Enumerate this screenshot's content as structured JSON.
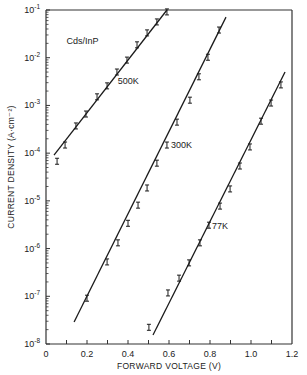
{
  "chart_data": {
    "type": "scatter",
    "title": "",
    "xlabel": "FORWARD VOLTAGE (V)",
    "ylabel": "CURRENT DENSITY (A·cm⁻²)",
    "xlim": [
      0,
      1.2
    ],
    "ylim_log10": [
      -8,
      -1
    ],
    "yscale": "log",
    "grid": false,
    "x_ticks": [
      {
        "value": 0,
        "label": "0"
      },
      {
        "value": 0.2,
        "label": "0.2"
      },
      {
        "value": 0.4,
        "label": "0.4"
      },
      {
        "value": 0.6,
        "label": "0.6"
      },
      {
        "value": 0.8,
        "label": "0.8"
      },
      {
        "value": 1.0,
        "label": "1.0"
      },
      {
        "value": 1.2,
        "label": "1.2"
      }
    ],
    "y_ticks": [
      {
        "exp": -1,
        "label": "10",
        "sup": "-1"
      },
      {
        "exp": -2,
        "label": "10",
        "sup": "-2"
      },
      {
        "exp": -3,
        "label": "10",
        "sup": "-3"
      },
      {
        "exp": -4,
        "label": "10",
        "sup": "-4"
      },
      {
        "exp": -5,
        "label": "10",
        "sup": "-5"
      },
      {
        "exp": -6,
        "label": "10",
        "sup": "-6"
      },
      {
        "exp": -7,
        "label": "10",
        "sup": "-7"
      },
      {
        "exp": -8,
        "label": "10",
        "sup": "-8"
      }
    ],
    "annotations": [
      {
        "text": "Cds/InP",
        "x": 0.1,
        "log10_y": -1.72
      },
      {
        "text": "500K",
        "x": 0.35,
        "log10_y": -2.55
      },
      {
        "text": "300K",
        "x": 0.61,
        "log10_y": -3.9
      },
      {
        "text": "77K",
        "x": 0.81,
        "log10_y": -5.58
      }
    ],
    "series": [
      {
        "name": "500K",
        "fit_line": {
          "x": [
            0.039,
            0.59
          ],
          "log10_y": [
            -4.04,
            -1.0
          ]
        },
        "points": [
          {
            "x": 0.054,
            "log10_y": -4.17
          },
          {
            "x": 0.093,
            "log10_y": -3.83
          },
          {
            "x": 0.146,
            "log10_y": -3.43
          },
          {
            "x": 0.195,
            "log10_y": -3.18
          },
          {
            "x": 0.249,
            "log10_y": -2.82
          },
          {
            "x": 0.298,
            "log10_y": -2.59
          },
          {
            "x": 0.346,
            "log10_y": -2.3
          },
          {
            "x": 0.395,
            "log10_y": -2.05
          },
          {
            "x": 0.444,
            "log10_y": -1.73
          },
          {
            "x": 0.493,
            "log10_y": -1.48
          },
          {
            "x": 0.541,
            "log10_y": -1.25
          },
          {
            "x": 0.59,
            "log10_y": -1.04
          }
        ]
      },
      {
        "name": "300K",
        "fit_line": {
          "x": [
            0.137,
            0.878
          ],
          "log10_y": [
            -7.54,
            -1.15
          ]
        },
        "points": [
          {
            "x": 0.2,
            "log10_y": -7.04
          },
          {
            "x": 0.298,
            "log10_y": -6.28
          },
          {
            "x": 0.351,
            "log10_y": -5.88
          },
          {
            "x": 0.4,
            "log10_y": -5.47
          },
          {
            "x": 0.449,
            "log10_y": -5.09
          },
          {
            "x": 0.493,
            "log10_y": -4.73
          },
          {
            "x": 0.541,
            "log10_y": -4.21
          },
          {
            "x": 0.59,
            "log10_y": -3.83
          },
          {
            "x": 0.639,
            "log10_y": -3.35
          },
          {
            "x": 0.702,
            "log10_y": -2.89
          },
          {
            "x": 0.746,
            "log10_y": -2.4
          },
          {
            "x": 0.79,
            "log10_y": -1.99
          },
          {
            "x": 0.844,
            "log10_y": -1.42
          }
        ]
      },
      {
        "name": "77K",
        "fit_line": {
          "x": [
            0.522,
            1.166
          ],
          "log10_y": [
            -7.81,
            -2.3
          ]
        },
        "points": [
          {
            "x": 0.502,
            "log10_y": -7.65
          },
          {
            "x": 0.595,
            "log10_y": -6.93
          },
          {
            "x": 0.649,
            "log10_y": -6.62
          },
          {
            "x": 0.698,
            "log10_y": -6.3
          },
          {
            "x": 0.751,
            "log10_y": -5.88
          },
          {
            "x": 0.795,
            "log10_y": -5.51
          },
          {
            "x": 0.849,
            "log10_y": -5.11
          },
          {
            "x": 0.898,
            "log10_y": -4.75
          },
          {
            "x": 0.946,
            "log10_y": -4.27
          },
          {
            "x": 0.995,
            "log10_y": -3.87
          },
          {
            "x": 1.049,
            "log10_y": -3.33
          },
          {
            "x": 1.098,
            "log10_y": -2.95
          },
          {
            "x": 1.146,
            "log10_y": -2.57
          }
        ]
      }
    ]
  },
  "style": {
    "ink_color": "#1a1a1a",
    "frame_color": "#333333",
    "background": "#ffffff"
  }
}
